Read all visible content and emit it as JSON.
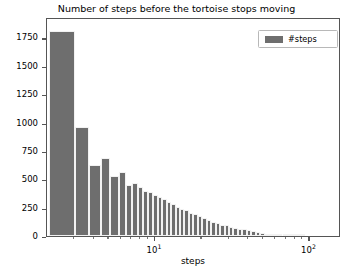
{
  "chart_data": {
    "type": "bar",
    "title": "Number of steps before the tortoise stops moving",
    "xlabel": "steps",
    "ylabel": "",
    "xscale": "log",
    "yscale": "linear",
    "xlim": [
      2.0,
      160.0
    ],
    "ylim": [
      0,
      1930
    ],
    "grid": false,
    "legend": {
      "position": "upper right",
      "entries": [
        {
          "label": "#steps",
          "color": "#6e6e6e"
        }
      ]
    },
    "xticks_major": [
      {
        "value": 10,
        "label": "10",
        "exponent": "1"
      },
      {
        "value": 100,
        "label": "10",
        "exponent": "2"
      }
    ],
    "xticks_minor": [
      3,
      4,
      5,
      6,
      7,
      8,
      9,
      20,
      30,
      40,
      50,
      60,
      70,
      80,
      90
    ],
    "yticks": [
      0,
      250,
      500,
      750,
      1000,
      1250,
      1500,
      1750
    ],
    "bar_color": "#6e6e6e",
    "bar_edge_color": "#f2f2f2",
    "bins": [
      {
        "left": 2.05,
        "right": 3.05,
        "value": 1810
      },
      {
        "left": 3.05,
        "right": 3.75,
        "value": 960
      },
      {
        "left": 3.75,
        "right": 4.45,
        "value": 630
      },
      {
        "left": 4.45,
        "right": 5.15,
        "value": 690
      },
      {
        "left": 5.15,
        "right": 5.85,
        "value": 525
      },
      {
        "left": 5.85,
        "right": 6.5,
        "value": 560
      },
      {
        "left": 6.5,
        "right": 7.1,
        "value": 450
      },
      {
        "left": 7.1,
        "right": 7.75,
        "value": 470
      },
      {
        "left": 7.75,
        "right": 8.4,
        "value": 430
      },
      {
        "left": 8.4,
        "right": 9.0,
        "value": 400
      },
      {
        "left": 9.0,
        "right": 9.7,
        "value": 390
      },
      {
        "left": 9.7,
        "right": 10.4,
        "value": 360
      },
      {
        "left": 10.4,
        "right": 11.1,
        "value": 340
      },
      {
        "left": 11.1,
        "right": 11.9,
        "value": 325
      },
      {
        "left": 11.9,
        "right": 12.7,
        "value": 300
      },
      {
        "left": 12.7,
        "right": 13.6,
        "value": 285
      },
      {
        "left": 13.6,
        "right": 14.5,
        "value": 260
      },
      {
        "left": 14.5,
        "right": 15.5,
        "value": 240
      },
      {
        "left": 15.5,
        "right": 16.6,
        "value": 225
      },
      {
        "left": 16.6,
        "right": 17.7,
        "value": 205
      },
      {
        "left": 17.7,
        "right": 18.9,
        "value": 190
      },
      {
        "left": 18.9,
        "right": 20.2,
        "value": 175
      },
      {
        "left": 20.2,
        "right": 21.6,
        "value": 160
      },
      {
        "left": 21.6,
        "right": 23.1,
        "value": 140
      },
      {
        "left": 23.1,
        "right": 24.7,
        "value": 120
      },
      {
        "left": 24.7,
        "right": 26.4,
        "value": 115
      },
      {
        "left": 26.4,
        "right": 28.2,
        "value": 100
      },
      {
        "left": 28.2,
        "right": 30.1,
        "value": 95
      },
      {
        "left": 30.1,
        "right": 32.2,
        "value": 80
      },
      {
        "left": 32.2,
        "right": 34.4,
        "value": 72
      },
      {
        "left": 34.4,
        "right": 36.8,
        "value": 65
      },
      {
        "left": 36.8,
        "right": 39.3,
        "value": 58
      },
      {
        "left": 39.3,
        "right": 42.0,
        "value": 50
      },
      {
        "left": 42.0,
        "right": 44.9,
        "value": 42
      },
      {
        "left": 44.9,
        "right": 48.0,
        "value": 34
      },
      {
        "left": 48.0,
        "right": 51.3,
        "value": 28
      },
      {
        "left": 51.3,
        "right": 54.8,
        "value": 22
      },
      {
        "left": 54.8,
        "right": 58.6,
        "value": 17
      },
      {
        "left": 58.6,
        "right": 62.6,
        "value": 13
      },
      {
        "left": 62.6,
        "right": 66.9,
        "value": 10
      },
      {
        "left": 66.9,
        "right": 71.5,
        "value": 8
      },
      {
        "left": 71.5,
        "right": 76.4,
        "value": 6
      },
      {
        "left": 76.4,
        "right": 81.7,
        "value": 4
      },
      {
        "left": 81.7,
        "right": 87.3,
        "value": 3
      },
      {
        "left": 87.3,
        "right": 93.3,
        "value": 2
      }
    ]
  }
}
